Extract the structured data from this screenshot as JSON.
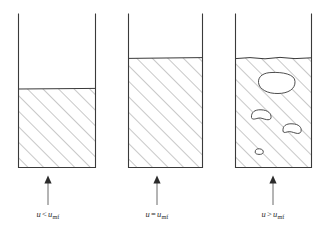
{
  "figure": {
    "background_color": "#ffffff",
    "line_color": "#3a3a3a",
    "hatch_color": "#6e6e6e",
    "arrow_color": "#6b6b6b",
    "text_color": "#2b2b2b"
  },
  "panels": [
    {
      "id": "panel-fixed-bed",
      "regime": "fixed bed",
      "caption": {
        "variable": "u",
        "operator": "<",
        "reference_variable": "u",
        "reference_subscript": "mf",
        "full_text": "u < umf"
      },
      "vessel": {
        "left": 18,
        "right": 96,
        "top": 14,
        "bottom": 168
      },
      "bed": {
        "surface_y": 89,
        "fill_height_fraction": 0.51,
        "hatched": true,
        "bubbles": []
      },
      "arrow": {
        "x": 48,
        "top_y": 176,
        "bottom_y": 205,
        "direction": "up"
      }
    },
    {
      "id": "panel-minimum-fluidization",
      "regime": "minimum fluidization",
      "caption": {
        "variable": "u",
        "operator": "=",
        "reference_variable": "u",
        "reference_subscript": "mf",
        "full_text": "u = umf"
      },
      "vessel": {
        "left": 128,
        "right": 203,
        "top": 14,
        "bottom": 168
      },
      "bed": {
        "surface_y": 58,
        "fill_height_fraction": 0.71,
        "hatched": true,
        "bubbles": []
      },
      "arrow": {
        "x": 157,
        "top_y": 176,
        "bottom_y": 205,
        "direction": "up"
      }
    },
    {
      "id": "panel-bubbling-fluidization",
      "regime": "bubbling fluidization",
      "caption": {
        "variable": "u",
        "operator": ">",
        "reference_variable": "u",
        "reference_subscript": "mf",
        "full_text": "u > umf"
      },
      "vessel": {
        "left": 235,
        "right": 312,
        "top": 14,
        "bottom": 168
      },
      "bed": {
        "surface_y": 58,
        "fill_height_fraction": 0.71,
        "hatched": true,
        "bubbles": [
          {
            "id": "bubble-large",
            "cx": 276,
            "cy": 83,
            "rx": 19,
            "ry": 10
          },
          {
            "id": "bubble-medium",
            "cx": 261,
            "cy": 116,
            "rx": 10,
            "ry": 6
          },
          {
            "id": "bubble-small",
            "cx": 292,
            "cy": 130,
            "rx": 9,
            "ry": 5.5
          },
          {
            "id": "bubble-tiny",
            "cx": 259,
            "cy": 152,
            "rx": 4,
            "ry": 2.8
          }
        ]
      },
      "arrow": {
        "x": 273,
        "top_y": 176,
        "bottom_y": 205,
        "direction": "up"
      }
    }
  ]
}
